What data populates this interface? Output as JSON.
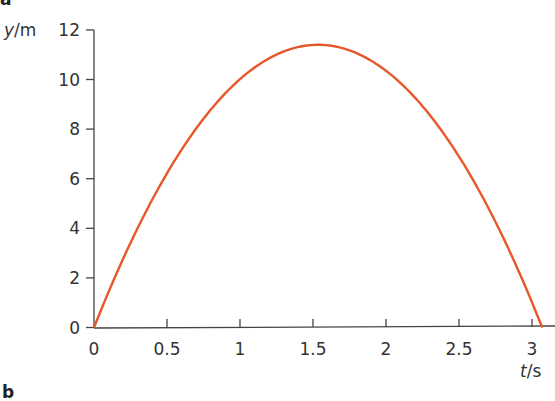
{
  "panel_labels": {
    "top": "a",
    "bottom": "b"
  },
  "chart_data": {
    "type": "line",
    "title": "",
    "xlabel": "t / s",
    "ylabel": "y / m",
    "xlabel_var": "t",
    "xlabel_unit": "s",
    "ylabel_var": "y",
    "ylabel_unit": "m",
    "xlim": [
      0,
      3.1
    ],
    "ylim": [
      0,
      12
    ],
    "xticks": [
      "0",
      "0.5",
      "1",
      "1.5",
      "2",
      "2.5",
      "3"
    ],
    "yticks": [
      "0",
      "2",
      "4",
      "6",
      "8",
      "10",
      "12"
    ],
    "grid": false,
    "legend": null,
    "series": [
      {
        "name": "height vs time",
        "color": "#e8572a",
        "x": [
          0,
          0.25,
          0.5,
          0.75,
          1.0,
          1.25,
          1.5,
          1.58,
          1.75,
          2.0,
          2.25,
          2.5,
          2.75,
          3.0,
          3.07
        ],
        "y": [
          0,
          3.4,
          6.3,
          8.6,
          10.2,
          11.1,
          11.4,
          11.4,
          11.3,
          10.5,
          9.0,
          7.0,
          4.3,
          0.8,
          0
        ]
      }
    ]
  }
}
